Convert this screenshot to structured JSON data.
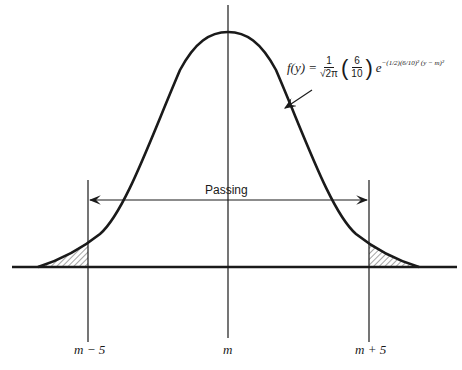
{
  "diagram": {
    "type": "normal-distribution-curve",
    "formula": {
      "lhs": "f(y) =",
      "coef_num": "1",
      "coef_den": "√2π",
      "paren_open": "(",
      "ratio_num": "6",
      "ratio_den": "10",
      "paren_close": ")",
      "base": "e",
      "exponent": "−(1/2)(6/10)² (y − m)²"
    },
    "passing_label": "Passing",
    "axis_labels": {
      "left": "m − 5",
      "center": "m",
      "right": "m + 5"
    },
    "shaded_regions": [
      "left-tail",
      "right-tail"
    ],
    "colors": {
      "line": "#1a1a1a",
      "background": "#ffffff"
    }
  }
}
